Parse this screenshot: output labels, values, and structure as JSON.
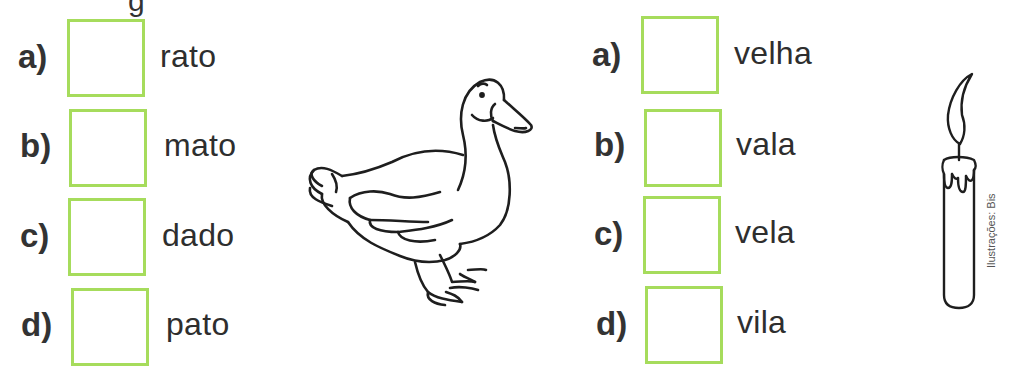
{
  "header": {
    "title_fragment": "g"
  },
  "left_exercise": {
    "items": [
      {
        "letter": "a)",
        "word": "rato"
      },
      {
        "letter": "b)",
        "word": "mato"
      },
      {
        "letter": "c)",
        "word": "dado"
      },
      {
        "letter": "d)",
        "word": "pato"
      }
    ],
    "illustration": "duck"
  },
  "right_exercise": {
    "items": [
      {
        "letter": "a)",
        "word": "velha"
      },
      {
        "letter": "b)",
        "word": "vala"
      },
      {
        "letter": "c)",
        "word": "vela"
      },
      {
        "letter": "d)",
        "word": "vila"
      }
    ],
    "illustration": "candle"
  },
  "credit": "Ilustrações: Bis",
  "colors": {
    "box_border": "#a6dc5c",
    "text": "#2e2e2e"
  }
}
